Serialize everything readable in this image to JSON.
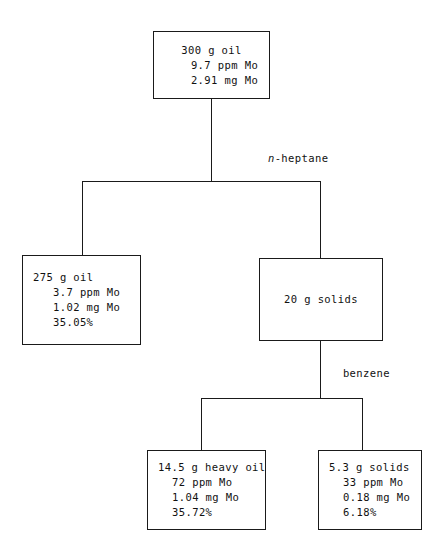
{
  "diagram": {
    "ink_color": "#1a1a1a",
    "background_color": "#ffffff",
    "nodes": {
      "feed": {
        "name": "feed-oil",
        "lines": [
          "300 g oil",
          "9.7 ppm Mo",
          "2.91 mg Mo"
        ]
      },
      "raffinate_oil": {
        "name": "deasphalted-oil",
        "lines": [
          "275 g oil",
          "3.7 ppm Mo",
          "1.02 mg Mo",
          "35.05%"
        ]
      },
      "solids_20g": {
        "name": "heptane-solids",
        "lines": [
          "20 g solids"
        ]
      },
      "heavy_oil": {
        "name": "benzene-heavy-oil",
        "lines": [
          "14.5 g heavy oil",
          "72 ppm Mo",
          "1.04 mg Mo",
          "35.72%"
        ]
      },
      "solids_53g": {
        "name": "benzene-insoluble-solids",
        "lines": [
          "5.3 g solids",
          "33 ppm Mo",
          "0.18 mg Mo",
          "6.18%"
        ]
      }
    },
    "edge_labels": {
      "heptane": {
        "italic_part": "n",
        "rest": "-heptane"
      },
      "benzene": {
        "text": "benzene"
      }
    }
  }
}
